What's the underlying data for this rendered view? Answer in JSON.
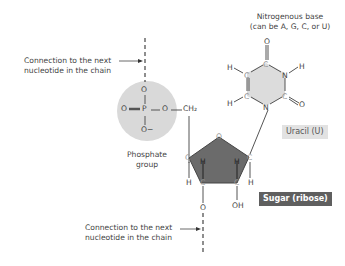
{
  "labels": {
    "top_connection": [
      "Connection to the next",
      "nucleotide in the chain"
    ],
    "bottom_connection": [
      "Connection to the next",
      "nucleotide in the chain"
    ],
    "base_title": [
      "Nitrogenous base",
      "(can be A, G, C, or U)"
    ],
    "phosphate": [
      "Phosphate",
      "group"
    ],
    "uracil_tag": "Uracil (U)",
    "sugar_tag": "Sugar (ribose)"
  },
  "atoms": {
    "phosphate": {
      "P": "P",
      "O_top": "O",
      "O_left": "O",
      "O_right": "O",
      "O_minus": "O−",
      "CH2": "CH₂"
    },
    "sugar": {
      "O_ring": "O",
      "C_left": "C",
      "C_right": "C",
      "C_bl": "C",
      "C_br": "C",
      "H1": "H",
      "H2": "H",
      "H3": "H",
      "H4": "H",
      "O_bottom": "O",
      "OH": "OH"
    },
    "base": {
      "O_top": "O",
      "C_top": "C",
      "N_right": "N",
      "H_right": "H",
      "C_right": "C",
      "O_right": "O",
      "N_bottom": "N",
      "C_bl": "C",
      "C_tl": "C",
      "H_tl": "H",
      "H_bl": "H"
    }
  },
  "colors": {
    "phosphate_circle": "#d9d9d9",
    "sugar_fill": "#6b6b6b",
    "base_fill": "#dcdcdc",
    "line": "#555555",
    "tag_light": "#e2e2e2",
    "tag_dark": "#5f5f5f"
  }
}
